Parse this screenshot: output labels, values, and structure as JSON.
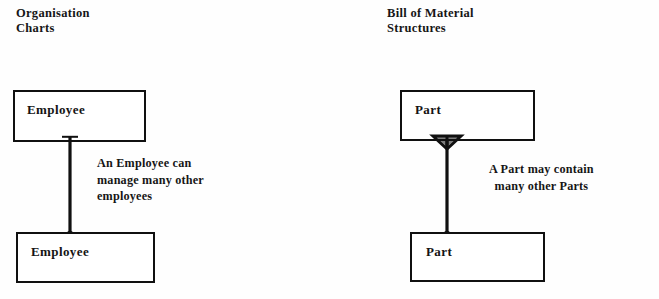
{
  "document": {
    "type": "entity-relationship-diagram",
    "ink_color": "#161616",
    "paper_color": "#fefefe"
  },
  "left_panel": {
    "heading": "Organisation\nCharts",
    "top_entity": "Employee",
    "bottom_entity": "Employee",
    "caption": "An Employee can\nmanage many other\nemployees",
    "relationship": {
      "top_end_marker": "plain",
      "bottom_end_marker": "crows-foot"
    }
  },
  "right_panel": {
    "heading": "Bill of Material\nStructures",
    "top_entity": "Part",
    "bottom_entity": "Part",
    "caption": "A Part may contain\nmany other Parts",
    "relationship": {
      "top_end_marker": "crows-foot",
      "bottom_end_marker": "crows-foot"
    }
  }
}
